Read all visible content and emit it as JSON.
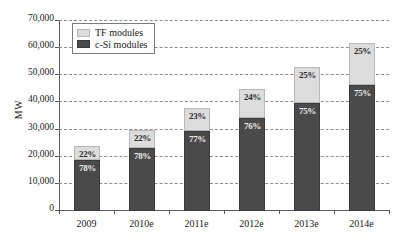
{
  "chart_data": {
    "type": "bar",
    "subtype": "stacked-bar",
    "title": "",
    "xlabel": "",
    "ylabel": "MW",
    "ylim": [
      0,
      70000
    ],
    "ytick_step": 10000,
    "ytick_labels": [
      "0",
      "10,000",
      "20,000",
      "30,000",
      "40,000",
      "50,000",
      "60,000",
      "70,000"
    ],
    "ytick_values": [
      0,
      10000,
      20000,
      30000,
      40000,
      50000,
      60000,
      70000
    ],
    "grid": true,
    "grid_style": "dashed-horizontal",
    "legend_position": "top-left",
    "categories": [
      "2009",
      "2010e",
      "2011e",
      "2012e",
      "2013e",
      "2014e"
    ],
    "series": [
      {
        "name": "c-Si modules",
        "color": "#4a4a4a",
        "values": [
          18700,
          23400,
          29300,
          34200,
          39800,
          46500
        ],
        "share_labels": [
          "78%",
          "78%",
          "77%",
          "76%",
          "75%",
          "75%"
        ]
      },
      {
        "name": "TF modules",
        "color": "#dcdcdc",
        "values": [
          5300,
          6600,
          8700,
          10800,
          13200,
          15500
        ],
        "share_labels": [
          "22%",
          "22%",
          "23%",
          "24%",
          "25%",
          "25%"
        ]
      }
    ],
    "totals": [
      24000,
      30000,
      38000,
      45000,
      53000,
      62000
    ],
    "stack_order": [
      "c-Si modules",
      "TF modules"
    ]
  },
  "legend": {
    "items": [
      {
        "label": "TF modules",
        "swatch": "light-gray-swatch"
      },
      {
        "label": "c-Si modules",
        "swatch": "dark-gray-swatch"
      }
    ]
  },
  "axes": {
    "y_title": "MW"
  },
  "colors": {
    "tf": "#dcdcdc",
    "csi": "#4a4a4a",
    "grid": "#8d8d8d",
    "axis": "#5a5a5a",
    "text": "#1a1a1a"
  }
}
